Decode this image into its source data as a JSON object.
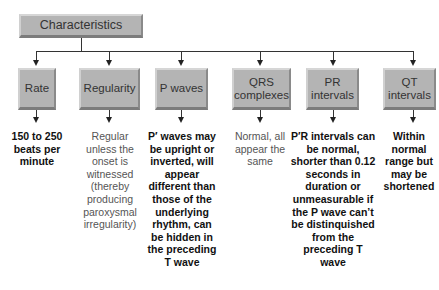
{
  "root": {
    "label": "Characteristics"
  },
  "nodes": [
    {
      "label": "Rate",
      "description": "150 to 250 beats per minute"
    },
    {
      "label": "Regularity",
      "description": "Regular unless the onset is witnessed (thereby producing paroxysmal irregularity)"
    },
    {
      "label": "P waves",
      "description": "P′ waves may be upright or inverted, will appear different than those of the underlying rhythm, can be hidden in the preceding T wave"
    },
    {
      "label": "QRS complexes",
      "description": "Normal, all appear the same"
    },
    {
      "label": "PR intervals",
      "description": "P′R intervals can be normal, shorter than 0.12 seconds in duration or unmeasurable if the P wave can’t be distinquished from the preceding T wave"
    },
    {
      "label": "QT intervals",
      "description": "Within normal range but may be shortened"
    }
  ]
}
